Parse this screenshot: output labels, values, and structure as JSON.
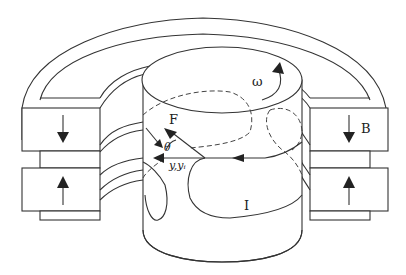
{
  "diagram": {
    "title": "",
    "labels": {
      "omega": "ω",
      "force": "F",
      "theta": "θ",
      "coords": "y,yᵢ",
      "field": "B",
      "current": "I"
    },
    "components": [
      "outer-yoke-arch",
      "upper-left-magnet",
      "lower-left-magnet",
      "upper-right-magnet",
      "lower-right-magnet",
      "central-rotating-cylinder",
      "current-loop",
      "force-vector-triangle"
    ],
    "magnet_field_directions": {
      "upper": "down",
      "lower": "up"
    },
    "colors": {
      "line": "#333333",
      "background": "#ffffff"
    }
  }
}
